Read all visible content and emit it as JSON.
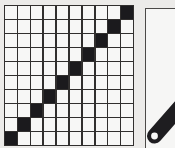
{
  "figure": {
    "background_color": "#f2f1ef"
  },
  "grid_panel": {
    "name": "diagonal-grid",
    "columns": 10,
    "rows": 10,
    "line_color": "#2e2c2b",
    "cell_empty_color": "#fdfdfc",
    "cell_filled_color": "#17161a",
    "pattern": "anti-diagonal",
    "filled_cells": [
      [
        0,
        9
      ],
      [
        1,
        8
      ],
      [
        2,
        7
      ],
      [
        3,
        6
      ],
      [
        4,
        5
      ],
      [
        5,
        4
      ],
      [
        6,
        3
      ],
      [
        7,
        2
      ],
      [
        8,
        1
      ],
      [
        9,
        0
      ]
    ],
    "matrix": [
      [
        0,
        0,
        0,
        0,
        0,
        0,
        0,
        0,
        0,
        1
      ],
      [
        0,
        0,
        0,
        0,
        0,
        0,
        0,
        0,
        1,
        0
      ],
      [
        0,
        0,
        0,
        0,
        0,
        0,
        0,
        1,
        0,
        0
      ],
      [
        0,
        0,
        0,
        0,
        0,
        0,
        1,
        0,
        0,
        0
      ],
      [
        0,
        0,
        0,
        0,
        0,
        1,
        0,
        0,
        0,
        0
      ],
      [
        0,
        0,
        0,
        0,
        1,
        0,
        0,
        0,
        0,
        0
      ],
      [
        0,
        0,
        0,
        1,
        0,
        0,
        0,
        0,
        0,
        0
      ],
      [
        0,
        0,
        1,
        0,
        0,
        0,
        0,
        0,
        0,
        0
      ],
      [
        0,
        1,
        0,
        0,
        0,
        0,
        0,
        0,
        0,
        0
      ],
      [
        1,
        0,
        0,
        0,
        0,
        0,
        0,
        0,
        0,
        0
      ]
    ]
  },
  "band_panel": {
    "name": "diagonal-bar-detail",
    "frame_color": "#4a4846",
    "panel_color": "#fcfcfb",
    "bar_color": "#1b1a1d",
    "hole_color": "#ffffff",
    "bar_description": "thick diagonal bar running from lower-left to upper-right",
    "hole_description": "white circular pivot hole at rounded lower-left end of bar"
  }
}
